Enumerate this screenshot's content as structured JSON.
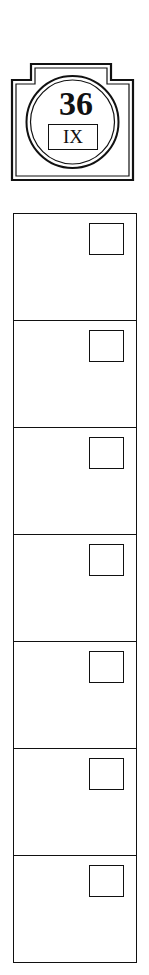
{
  "badge": {
    "number": "36",
    "roman": "IX"
  },
  "rows": [
    {
      "index": 1,
      "checked": false
    },
    {
      "index": 2,
      "checked": false
    },
    {
      "index": 3,
      "checked": false
    },
    {
      "index": 4,
      "checked": false
    },
    {
      "index": 5,
      "checked": false
    },
    {
      "index": 6,
      "checked": false
    },
    {
      "index": 7,
      "checked": false
    }
  ],
  "colors": {
    "ink": "#111111",
    "paper": "#ffffff"
  }
}
